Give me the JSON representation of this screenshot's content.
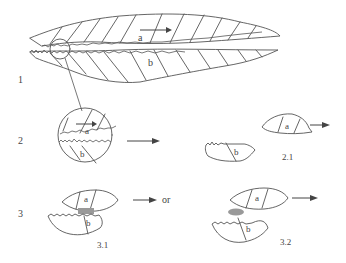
{
  "figure": {
    "rows": [
      {
        "id": "row-1",
        "label": "1"
      },
      {
        "id": "row-2",
        "label": "2"
      },
      {
        "id": "row-3",
        "label": "3"
      }
    ],
    "sublabels": {
      "top_a": "a",
      "top_b": "b",
      "zoom_a": "a",
      "zoom_b": "b",
      "r21_a": "a",
      "r21_b": "b",
      "r21_caption": "2.1",
      "r31_a": "a",
      "r31_b": "b",
      "r31_caption": "3.1",
      "r31_or": "or",
      "r32_a": "a",
      "r32_b": "b",
      "r32_caption": "3.2"
    },
    "colors": {
      "line": "#555555",
      "background": "#ffffff"
    }
  }
}
